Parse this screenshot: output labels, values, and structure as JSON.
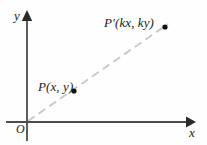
{
  "figure": {
    "background_color": "#fefefe",
    "axis_color": "#4c4c4c",
    "ray_color": "#c9c9c9",
    "point_color": "#111111",
    "text_color": "#1b1b1b",
    "width": 207,
    "height": 145
  },
  "axes": {
    "origin_label": "O",
    "x_label": "x",
    "y_label": "y",
    "origin_px": {
      "x": 27,
      "y": 122
    },
    "x_axis": {
      "start_px": {
        "x": 6,
        "y": 122
      },
      "end_px": {
        "x": 195,
        "y": 122
      },
      "arrow": "right"
    },
    "y_axis": {
      "start_px": {
        "x": 27,
        "y": 140
      },
      "end_px": {
        "x": 27,
        "y": 11
      },
      "arrow": "up"
    }
  },
  "points": [
    {
      "id": "P",
      "label": "P(x, y)",
      "coords_px": {
        "x": 74,
        "y": 91
      },
      "dot_radius": 2.6
    },
    {
      "id": "P-prime",
      "label": "P′(kx, ky)",
      "coords_px": {
        "x": 165,
        "y": 27
      },
      "dot_radius": 2.6
    }
  ],
  "ray": {
    "name": "dilation-ray",
    "style": "dashed",
    "dash_pattern": "8 5",
    "start_px": {
      "x": 28,
      "y": 121
    },
    "end_px": {
      "x": 168,
      "y": 24
    }
  }
}
